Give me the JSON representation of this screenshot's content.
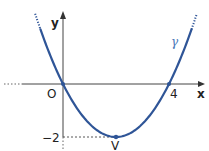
{
  "diagram": {
    "title": "",
    "function": "f(x) = 0.5x^2 - 2x",
    "curve_label": "γ",
    "labels": {
      "x_axis": "x",
      "y_axis": "y",
      "origin": "O",
      "x_tick": "4",
      "y_tick": "−2",
      "vertex": "V"
    },
    "points": [
      {
        "name": "O",
        "x": 0,
        "y": 0
      },
      {
        "name": "4",
        "x": 4,
        "y": 0
      },
      {
        "name": "V",
        "x": 2,
        "y": -2
      }
    ],
    "colors": {
      "curve": "#2f5597",
      "axes": "#444444",
      "text": "#222222",
      "curve_label": "#4a78b8"
    }
  }
}
